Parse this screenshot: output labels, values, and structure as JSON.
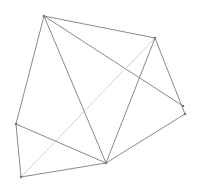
{
  "diagram": {
    "type": "graph",
    "width": 202,
    "height": 191,
    "background": "#ffffff",
    "colors": {
      "edge": "#8a8a8a",
      "edge_faint": "#c4c4c4",
      "vertex": "#777777"
    },
    "nodes": [
      {
        "id": "A",
        "x": 44,
        "y": 16
      },
      {
        "id": "B",
        "x": 155,
        "y": 38
      },
      {
        "id": "C",
        "x": 183,
        "y": 106
      },
      {
        "id": "D",
        "x": 185,
        "y": 114
      },
      {
        "id": "E",
        "x": 16,
        "y": 124
      },
      {
        "id": "F",
        "x": 106,
        "y": 163
      },
      {
        "id": "G",
        "x": 21,
        "y": 177
      }
    ],
    "edges": [
      {
        "from": "A",
        "to": "B",
        "style": "normal"
      },
      {
        "from": "A",
        "to": "E",
        "style": "normal"
      },
      {
        "from": "A",
        "to": "F",
        "style": "normal"
      },
      {
        "from": "A",
        "to": "C",
        "style": "normal"
      },
      {
        "from": "B",
        "to": "F",
        "style": "normal"
      },
      {
        "from": "B",
        "to": "D",
        "style": "normal"
      },
      {
        "from": "B",
        "to": "G",
        "style": "faint"
      },
      {
        "from": "D",
        "to": "F",
        "style": "normal"
      },
      {
        "from": "E",
        "to": "F",
        "style": "normal"
      },
      {
        "from": "E",
        "to": "G",
        "style": "normal"
      },
      {
        "from": "G",
        "to": "F",
        "style": "normal"
      }
    ]
  }
}
